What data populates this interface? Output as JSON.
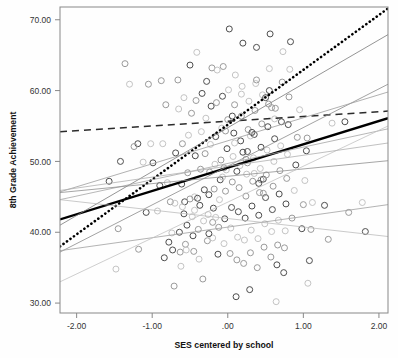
{
  "chart_data": {
    "type": "scatter",
    "title": "",
    "xlabel": "SES centered by school",
    "ylabel": "8th Grade Achievement",
    "xlim": [
      -2.22,
      2.12
    ],
    "ylim": [
      28.6,
      71.8
    ],
    "xticks": [
      -2.0,
      -1.0,
      0.0,
      1.0,
      2.0
    ],
    "xticklabels": [
      "-2.00",
      "-1.00",
      ".00",
      "1.00",
      "2.00"
    ],
    "yticks": [
      30.0,
      40.0,
      50.0,
      60.0,
      70.0
    ],
    "yticklabels": [
      "30.00",
      "40.00",
      "50.00",
      "60.00",
      "70.00"
    ],
    "grid": false,
    "legend": "none",
    "point_marker": "open-circle",
    "point_colors": [
      "#4d4d4d",
      "#9a9a9a",
      "#c4c4c4"
    ],
    "lines": [
      {
        "name": "overall-fit-solid-thick",
        "style": "solid",
        "color": "#000000",
        "width": 2.3,
        "x": [
          -2.22,
          2.12
        ],
        "y": [
          41.8,
          56.1
        ]
      },
      {
        "name": "dotted-steep-fit",
        "style": "dotted",
        "color": "#000000",
        "width": 2.6,
        "x": [
          -2.22,
          2.12
        ],
        "y": [
          38.0,
          71.6
        ]
      },
      {
        "name": "dashed-flat-fit",
        "style": "dashed",
        "color": "#2b2b2b",
        "width": 1.5,
        "x": [
          -2.22,
          2.12
        ],
        "y": [
          54.2,
          57.1
        ]
      },
      {
        "name": "school-line-1",
        "style": "solid",
        "color": "#7a7a7a",
        "width": 0.8,
        "x": [
          -2.22,
          2.12
        ],
        "y": [
          41.0,
          67.9
        ]
      },
      {
        "name": "school-line-2",
        "style": "solid",
        "color": "#8a8a8a",
        "width": 0.8,
        "x": [
          -2.22,
          2.12
        ],
        "y": [
          37.2,
          60.9
        ]
      },
      {
        "name": "school-line-3",
        "style": "solid",
        "color": "#9d9d9d",
        "width": 0.8,
        "x": [
          -2.22,
          2.12
        ],
        "y": [
          45.7,
          59.8
        ]
      },
      {
        "name": "school-line-4",
        "style": "solid",
        "color": "#a5a5a5",
        "width": 0.8,
        "x": [
          -2.22,
          2.12
        ],
        "y": [
          44.6,
          54.6
        ]
      },
      {
        "name": "school-line-5",
        "style": "solid",
        "color": "#8f8f8f",
        "width": 0.8,
        "x": [
          -2.22,
          2.12
        ],
        "y": [
          45.6,
          50.1
        ]
      },
      {
        "name": "school-line-6",
        "style": "solid",
        "color": "#a0a0a0",
        "width": 0.8,
        "x": [
          -2.22,
          2.12
        ],
        "y": [
          37.4,
          43.9
        ]
      },
      {
        "name": "school-line-7",
        "style": "solid",
        "color": "#bdbdbd",
        "width": 0.8,
        "x": [
          -2.22,
          2.12
        ],
        "y": [
          44.6,
          39.4
        ]
      },
      {
        "name": "school-line-8",
        "style": "solid",
        "color": "#c2c2c2",
        "width": 0.8,
        "x": [
          -2.22,
          2.12
        ],
        "y": [
          33.0,
          55.0
        ]
      },
      {
        "name": "school-line-9",
        "style": "solid",
        "color": "#b0b0b0",
        "width": 0.8,
        "x": [
          -2.22,
          2.12
        ],
        "y": [
          45.9,
          52.6
        ]
      }
    ],
    "points": [
      [
        -1.57,
        47.2
      ],
      [
        -1.36,
        63.8
      ],
      [
        -1.3,
        60.9
      ],
      [
        -1.19,
        52.5
      ],
      [
        -1.18,
        37.6
      ],
      [
        -1.12,
        49.9
      ],
      [
        -1.08,
        42.8
      ],
      [
        -1.05,
        60.9
      ],
      [
        -1.02,
        52.5
      ],
      [
        -0.99,
        49.8
      ],
      [
        -1.45,
        40.5
      ],
      [
        -1.48,
        34.8
      ],
      [
        -1.42,
        50.0
      ],
      [
        -1.24,
        52.1
      ],
      [
        -0.93,
        43.0
      ],
      [
        -0.9,
        46.6
      ],
      [
        -0.88,
        61.4
      ],
      [
        -0.86,
        52.5
      ],
      [
        -0.84,
        36.4
      ],
      [
        -0.82,
        58.0
      ],
      [
        -0.8,
        47.0
      ],
      [
        -0.78,
        38.6
      ],
      [
        -0.76,
        44.3
      ],
      [
        -0.74,
        39.9
      ],
      [
        -0.73,
        37.5
      ],
      [
        -0.71,
        32.4
      ],
      [
        -0.7,
        44.1
      ],
      [
        -0.69,
        51.2
      ],
      [
        -0.66,
        61.5
      ],
      [
        -0.65,
        57.4
      ],
      [
        -0.64,
        40.0
      ],
      [
        -0.63,
        37.2
      ],
      [
        -0.62,
        35.2
      ],
      [
        -0.61,
        46.8
      ],
      [
        -0.6,
        52.5
      ],
      [
        -0.58,
        59.0
      ],
      [
        -0.57,
        44.3
      ],
      [
        -0.56,
        38.3
      ],
      [
        -0.55,
        37.5
      ],
      [
        -0.54,
        41.0
      ],
      [
        -0.53,
        48.4
      ],
      [
        -0.52,
        53.7
      ],
      [
        -0.5,
        63.6
      ],
      [
        -0.48,
        56.8
      ],
      [
        -0.47,
        42.2
      ],
      [
        -0.46,
        39.5
      ],
      [
        -0.45,
        37.3
      ],
      [
        -0.44,
        45.0
      ],
      [
        -0.43,
        50.8
      ],
      [
        -0.42,
        58.6
      ],
      [
        -0.41,
        65.4
      ],
      [
        -0.4,
        44.8
      ],
      [
        -0.39,
        40.4
      ],
      [
        -0.38,
        36.2
      ],
      [
        -0.37,
        43.8
      ],
      [
        -0.36,
        48.9
      ],
      [
        -0.35,
        54.2
      ],
      [
        -0.34,
        59.6
      ],
      [
        -0.33,
        33.4
      ],
      [
        -0.32,
        41.6
      ],
      [
        -0.31,
        46.0
      ],
      [
        -0.3,
        51.1
      ],
      [
        -0.29,
        56.1
      ],
      [
        -0.28,
        61.3
      ],
      [
        -0.27,
        38.8
      ],
      [
        -0.26,
        42.5
      ],
      [
        -0.25,
        45.3
      ],
      [
        -0.24,
        48.5
      ],
      [
        -0.23,
        52.4
      ],
      [
        -0.22,
        57.8
      ],
      [
        -0.21,
        63.2
      ],
      [
        -0.2,
        39.2
      ],
      [
        -0.19,
        43.4
      ],
      [
        -0.18,
        46.1
      ],
      [
        -0.17,
        49.6
      ],
      [
        -0.16,
        53.5
      ],
      [
        -0.15,
        58.3
      ],
      [
        -0.14,
        62.9
      ],
      [
        -0.13,
        36.9
      ],
      [
        -0.12,
        40.7
      ],
      [
        -0.11,
        44.6
      ],
      [
        -0.1,
        47.4
      ],
      [
        -0.09,
        50.2
      ],
      [
        -0.08,
        54.7
      ],
      [
        -0.07,
        59.2
      ],
      [
        -0.06,
        63.4
      ],
      [
        -0.05,
        38.4
      ],
      [
        -0.04,
        41.9
      ],
      [
        -0.03,
        45.8
      ],
      [
        -0.02,
        48.8
      ],
      [
        -0.01,
        51.8
      ],
      [
        0.0,
        55.9
      ],
      [
        0.01,
        60.1
      ],
      [
        0.02,
        68.7
      ],
      [
        0.03,
        37.0
      ],
      [
        0.04,
        40.6
      ],
      [
        0.05,
        43.5
      ],
      [
        0.06,
        47.1
      ],
      [
        0.07,
        50.7
      ],
      [
        0.08,
        54.0
      ],
      [
        0.09,
        58.0
      ],
      [
        0.1,
        62.2
      ],
      [
        0.11,
        30.9
      ],
      [
        0.12,
        36.1
      ],
      [
        0.13,
        39.3
      ],
      [
        0.14,
        42.9
      ],
      [
        0.15,
        46.3
      ],
      [
        0.16,
        49.4
      ],
      [
        0.17,
        52.9
      ],
      [
        0.18,
        56.4
      ],
      [
        0.19,
        60.6
      ],
      [
        0.2,
        66.7
      ],
      [
        0.21,
        35.6
      ],
      [
        0.22,
        38.9
      ],
      [
        0.23,
        42.0
      ],
      [
        0.24,
        45.1
      ],
      [
        0.25,
        48.2
      ],
      [
        0.26,
        51.4
      ],
      [
        0.27,
        54.5
      ],
      [
        0.28,
        58.5
      ],
      [
        0.29,
        31.9
      ],
      [
        0.3,
        37.1
      ],
      [
        0.31,
        40.3
      ],
      [
        0.32,
        43.7
      ],
      [
        0.33,
        47.2
      ],
      [
        0.34,
        50.5
      ],
      [
        0.35,
        53.8
      ],
      [
        0.36,
        57.2
      ],
      [
        0.37,
        61.0
      ],
      [
        0.38,
        66.1
      ],
      [
        0.39,
        35.0
      ],
      [
        0.4,
        39.1
      ],
      [
        0.41,
        42.4
      ],
      [
        0.42,
        45.6
      ],
      [
        0.43,
        49.0
      ],
      [
        0.44,
        52.0
      ],
      [
        0.45,
        55.3
      ],
      [
        0.46,
        59.4
      ],
      [
        0.47,
        47.5
      ],
      [
        0.48,
        37.9
      ],
      [
        0.49,
        41.2
      ],
      [
        0.5,
        44.9
      ],
      [
        0.51,
        48.1
      ],
      [
        0.52,
        51.6
      ],
      [
        0.53,
        54.9
      ],
      [
        0.54,
        58.1
      ],
      [
        0.55,
        63.1
      ],
      [
        0.56,
        68.0
      ],
      [
        0.57,
        36.5
      ],
      [
        0.58,
        40.1
      ],
      [
        0.59,
        43.2
      ],
      [
        0.6,
        46.5
      ],
      [
        0.61,
        50.0
      ],
      [
        0.62,
        53.2
      ],
      [
        0.63,
        57.5
      ],
      [
        0.64,
        30.2
      ],
      [
        0.65,
        35.4
      ],
      [
        0.66,
        38.2
      ],
      [
        0.67,
        41.7
      ],
      [
        0.68,
        45.4
      ],
      [
        0.69,
        48.7
      ],
      [
        0.7,
        52.2
      ],
      [
        0.71,
        55.6
      ],
      [
        0.72,
        61.2
      ],
      [
        0.73,
        65.5
      ],
      [
        0.74,
        34.3
      ],
      [
        0.75,
        37.8
      ],
      [
        0.76,
        40.2
      ],
      [
        0.77,
        44.0
      ],
      [
        0.78,
        47.6
      ],
      [
        0.79,
        51.0
      ],
      [
        0.8,
        55.2
      ],
      [
        0.81,
        59.1
      ],
      [
        0.82,
        63.0
      ],
      [
        0.83,
        66.9
      ],
      [
        0.85,
        42.0
      ],
      [
        0.88,
        45.9
      ],
      [
        0.9,
        49.5
      ],
      [
        0.92,
        53.4
      ],
      [
        0.95,
        57.3
      ],
      [
        0.98,
        40.5
      ],
      [
        1.0,
        43.9
      ],
      [
        1.02,
        47.3
      ],
      [
        1.04,
        51.5
      ],
      [
        1.05,
        53.3
      ],
      [
        1.06,
        32.8
      ],
      [
        1.08,
        36.0
      ],
      [
        1.1,
        40.4
      ],
      [
        1.12,
        44.2
      ],
      [
        1.28,
        43.8
      ],
      [
        1.33,
        39.0
      ],
      [
        1.38,
        55.4
      ],
      [
        1.55,
        55.6
      ],
      [
        1.6,
        42.8
      ],
      [
        1.78,
        44.2
      ],
      [
        1.82,
        40.1
      ],
      [
        0.44,
        47.4
      ],
      [
        0.3,
        53.6
      ],
      [
        0.32,
        54.1
      ],
      [
        -0.05,
        49.1
      ],
      [
        -0.07,
        47.8
      ],
      [
        0.12,
        48.6
      ],
      [
        0.24,
        50.3
      ],
      [
        -0.6,
        43.6
      ],
      [
        -0.58,
        42.6
      ],
      [
        -0.5,
        44.7
      ],
      [
        -0.44,
        43.1
      ],
      [
        -0.25,
        39.8
      ],
      [
        -0.2,
        41.4
      ],
      [
        -0.16,
        42.1
      ],
      [
        0.55,
        60.0
      ],
      [
        0.58,
        57.6
      ],
      [
        0.62,
        56.0
      ],
      [
        0.5,
        59.0
      ],
      [
        0.38,
        61.5
      ],
      [
        0.18,
        59.5
      ],
      [
        0.06,
        56.4
      ],
      [
        -0.03,
        54.3
      ],
      [
        0.09,
        52.6
      ],
      [
        0.2,
        51.3
      ],
      [
        0.26,
        49.8
      ],
      [
        0.35,
        48.3
      ],
      [
        0.41,
        46.9
      ],
      [
        0.47,
        45.5
      ]
    ]
  }
}
